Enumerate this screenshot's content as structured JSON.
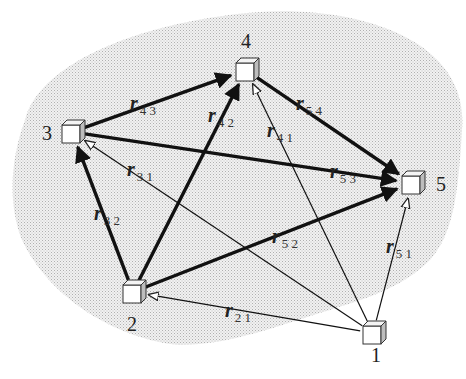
{
  "diagram": {
    "type": "directed network graph",
    "region": {
      "fill_pattern": "stippled",
      "color": "#c8c8c8"
    },
    "nodes": [
      {
        "id": "1",
        "label": "1",
        "x": 373,
        "y": 333,
        "label_x": 371,
        "label_y": 362
      },
      {
        "id": "2",
        "label": "2",
        "x": 133,
        "y": 292,
        "label_x": 127,
        "label_y": 331
      },
      {
        "id": "3",
        "label": "3",
        "x": 72,
        "y": 132,
        "label_x": 42,
        "label_y": 140
      },
      {
        "id": "4",
        "label": "4",
        "x": 246,
        "y": 70,
        "label_x": 241,
        "label_y": 48
      },
      {
        "id": "5",
        "label": "5",
        "x": 412,
        "y": 183,
        "label_x": 436,
        "label_y": 191
      }
    ],
    "edges": [
      {
        "id": "r43",
        "from": "3",
        "to": "4",
        "style": "thick",
        "label": "r",
        "sub": "4 3",
        "lx": 130,
        "ly": 110
      },
      {
        "id": "r42",
        "from": "2",
        "to": "4",
        "style": "thick",
        "label": "r",
        "sub": "4 2",
        "lx": 208,
        "ly": 122
      },
      {
        "id": "r54",
        "from": "4",
        "to": "5",
        "style": "thick",
        "label": "r",
        "sub": "5 4",
        "lx": 296,
        "ly": 110
      },
      {
        "id": "r41",
        "from": "1",
        "to": "4",
        "style": "thin",
        "label": "r",
        "sub": "4 1",
        "lx": 267,
        "ly": 137
      },
      {
        "id": "r53",
        "from": "3",
        "to": "5",
        "style": "thick",
        "label": "r",
        "sub": "5 3",
        "lx": 330,
        "ly": 178
      },
      {
        "id": "r31",
        "from": "1",
        "to": "3",
        "style": "thin",
        "label": "r",
        "sub": "3 1",
        "lx": 127,
        "ly": 176
      },
      {
        "id": "r32",
        "from": "2",
        "to": "3",
        "style": "thick",
        "label": "r",
        "sub": "3 2",
        "lx": 94,
        "ly": 220
      },
      {
        "id": "r52",
        "from": "2",
        "to": "5",
        "style": "thick",
        "label": "r",
        "sub": "5 2",
        "lx": 272,
        "ly": 243
      },
      {
        "id": "r51",
        "from": "1",
        "to": "5",
        "style": "thin",
        "label": "r",
        "sub": "5 1",
        "lx": 386,
        "ly": 253
      },
      {
        "id": "r21",
        "from": "1",
        "to": "2",
        "style": "thin",
        "label": "r",
        "sub": "2 1",
        "lx": 225,
        "ly": 317
      }
    ]
  }
}
